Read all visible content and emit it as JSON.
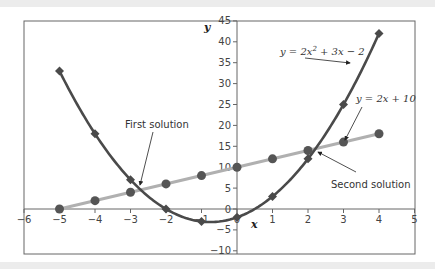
{
  "chart_data": {
    "type": "line",
    "title": "",
    "xlabel": "x",
    "ylabel": "y",
    "xlim": [
      -6,
      5
    ],
    "ylim": [
      -10,
      45
    ],
    "x_ticks": [
      -6,
      -5,
      -4,
      -3,
      -2,
      -1,
      0,
      1,
      2,
      3,
      4,
      5
    ],
    "y_ticks": [
      -10,
      -5,
      0,
      5,
      10,
      15,
      20,
      25,
      30,
      35,
      40,
      45
    ],
    "grid": false,
    "series": [
      {
        "name": "y = 2x² + 3x − 2",
        "marker": "diamond",
        "color": "#4a4a4a",
        "x": [
          -5,
          -4,
          -3,
          -2,
          -1,
          0,
          1,
          2,
          3,
          4
        ],
        "values": [
          33,
          18,
          7,
          0,
          -3,
          -2,
          3,
          12,
          25,
          42
        ]
      },
      {
        "name": "y = 2x + 10",
        "marker": "circle",
        "color": "#b0b0b0",
        "marker_color": "#555555",
        "x": [
          -5,
          -4,
          -3,
          -2,
          -1,
          0,
          1,
          2,
          3,
          4
        ],
        "values": [
          0,
          2,
          4,
          6,
          8,
          10,
          12,
          14,
          16,
          18
        ]
      }
    ],
    "annotations": [
      {
        "text": "First solution",
        "point": [
          -2.7,
          4.6
        ]
      },
      {
        "text": "Second solution",
        "point": [
          2.2,
          14.4
        ]
      },
      {
        "text": "y = 2x² + 3x − 2",
        "points_to_series": 0
      },
      {
        "text": "y = 2x + 10",
        "points_to_series": 1
      }
    ]
  },
  "labels": {
    "x_axis": "x",
    "y_axis": "y",
    "first_solution": "First solution",
    "second_solution": "Second solution",
    "quad_eq_prefix": "y = 2x",
    "quad_eq_sup": "2",
    "quad_eq_suffix": " + 3x − 2",
    "lin_eq": "y = 2x + 10"
  }
}
